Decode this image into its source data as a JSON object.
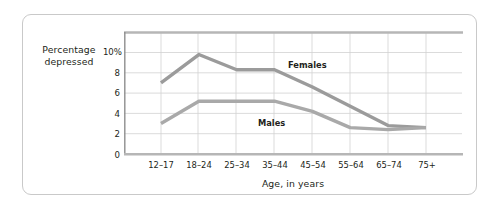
{
  "figure": {
    "y_axis_title_line1": "Percentage",
    "y_axis_title_line2": "depressed",
    "x_axis_title": "Age, in years"
  },
  "chart_data": {
    "type": "line",
    "title": "",
    "subtitle": "",
    "xlabel": "Age, in years",
    "ylabel": "Percentage depressed",
    "categories": [
      "12–17",
      "18–24",
      "25–34",
      "35–44",
      "45–54",
      "55–64",
      "65–74",
      "75+"
    ],
    "ylim": [
      0,
      11
    ],
    "ytick_labels": [
      "0",
      "2",
      "4",
      "6",
      "8",
      "10%"
    ],
    "ytick_values": [
      0,
      2,
      4,
      6,
      8,
      10
    ],
    "grid": true,
    "legend_position": "inline-annotations",
    "series": [
      {
        "name": "Females",
        "color": "#9b9b9b",
        "values": [
          7.0,
          9.8,
          8.3,
          8.3,
          6.6,
          4.7,
          2.8,
          2.6
        ]
      },
      {
        "name": "Males",
        "color": "#a9a9a9",
        "values": [
          3.0,
          5.2,
          5.2,
          5.2,
          4.2,
          2.6,
          2.4,
          2.6
        ]
      }
    ],
    "annotations": [
      {
        "text": "Females",
        "x_category": "45–54",
        "y": 9.0
      },
      {
        "text": "Males",
        "x_category": "35–44",
        "y": 3.6
      }
    ]
  }
}
